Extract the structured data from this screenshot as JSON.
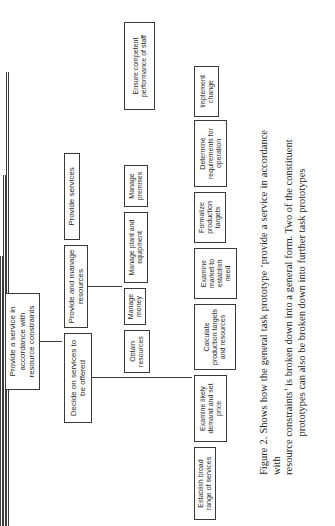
{
  "diagram": {
    "orientation": "rotated-90-counterclockwise",
    "root": {
      "label": "Provide a service in accordance with resource constraints"
    },
    "level1": [
      {
        "label": "Decide on services to be offered"
      },
      {
        "label": "Provide and manage resources"
      },
      {
        "label": "Provide services"
      }
    ],
    "resources_children": [
      {
        "label": "Obtain resources"
      },
      {
        "label": "Manage money"
      },
      {
        "label": "Manage plant and equipment"
      },
      {
        "label": "Manage premises"
      },
      {
        "label": "Ensure competent performance of staff"
      }
    ],
    "decide_children": [
      {
        "label": "Establish broad range of services"
      },
      {
        "label": "Examine likely demand and set price"
      },
      {
        "label": "Calculate production targets and resources"
      },
      {
        "label": "Examine market to establish need"
      },
      {
        "label": "Formalize production targets"
      },
      {
        "label": "Determine requirements for operation"
      },
      {
        "label": "Implement change"
      }
    ]
  },
  "caption": {
    "line1": "Figure 2.  Shows how the general task prototype ‘provide a service in accordance with",
    "line2": "resource constraints’ is broken down into a general form.  Two of the constituent",
    "line3": "prototypes can also be broken down into further task prototypes"
  }
}
